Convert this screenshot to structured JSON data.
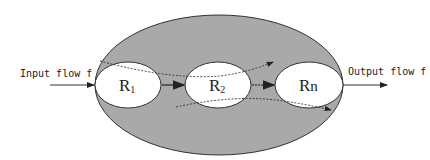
{
  "diagram": {
    "input_label": "Input flow f",
    "output_label": "Output flow f",
    "regions": [
      {
        "main": "R",
        "sub": "1"
      },
      {
        "main": "R",
        "sub": "2"
      },
      {
        "main": "R",
        "sub": "n"
      }
    ],
    "colors": {
      "outer_fill": "#a9a9a9",
      "inner_fill": "#ffffff",
      "stroke": "#333333"
    }
  }
}
